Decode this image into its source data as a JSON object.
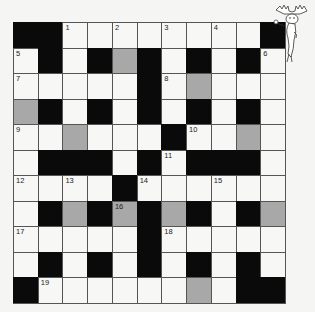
{
  "puzzle": {
    "rows": 11,
    "cols": 11,
    "legend": {
      "B": "black-block",
      "W": "white-cell",
      "G": "shaded-cell"
    },
    "grid": [
      [
        "B",
        "B",
        "W",
        "W",
        "W",
        "W",
        "W",
        "W",
        "W",
        "W",
        "B"
      ],
      [
        "W",
        "B",
        "W",
        "B",
        "G",
        "B",
        "W",
        "B",
        "W",
        "B",
        "W"
      ],
      [
        "W",
        "W",
        "W",
        "W",
        "W",
        "B",
        "W",
        "G",
        "W",
        "W",
        "W"
      ],
      [
        "G",
        "B",
        "W",
        "B",
        "W",
        "B",
        "W",
        "B",
        "W",
        "B",
        "W"
      ],
      [
        "W",
        "W",
        "G",
        "W",
        "W",
        "W",
        "B",
        "W",
        "W",
        "G",
        "W"
      ],
      [
        "W",
        "B",
        "B",
        "B",
        "W",
        "B",
        "W",
        "B",
        "B",
        "B",
        "W"
      ],
      [
        "W",
        "W",
        "W",
        "W",
        "B",
        "W",
        "W",
        "W",
        "W",
        "W",
        "W"
      ],
      [
        "W",
        "B",
        "G",
        "B",
        "G",
        "B",
        "G",
        "B",
        "W",
        "B",
        "G"
      ],
      [
        "W",
        "W",
        "W",
        "W",
        "W",
        "B",
        "W",
        "W",
        "W",
        "W",
        "W"
      ],
      [
        "W",
        "B",
        "W",
        "B",
        "W",
        "B",
        "W",
        "B",
        "W",
        "B",
        "W"
      ],
      [
        "B",
        "W",
        "W",
        "W",
        "W",
        "W",
        "W",
        "G",
        "W",
        "B",
        "B"
      ]
    ],
    "numbers": [
      {
        "row": 0,
        "col": 2,
        "n": "1"
      },
      {
        "row": 0,
        "col": 4,
        "n": "2"
      },
      {
        "row": 0,
        "col": 6,
        "n": "3"
      },
      {
        "row": 0,
        "col": 8,
        "n": "4"
      },
      {
        "row": 1,
        "col": 0,
        "n": "5"
      },
      {
        "row": 1,
        "col": 10,
        "n": "6"
      },
      {
        "row": 2,
        "col": 0,
        "n": "7"
      },
      {
        "row": 2,
        "col": 6,
        "n": "8"
      },
      {
        "row": 4,
        "col": 0,
        "n": "9"
      },
      {
        "row": 4,
        "col": 7,
        "n": "10"
      },
      {
        "row": 5,
        "col": 6,
        "n": "11"
      },
      {
        "row": 6,
        "col": 0,
        "n": "12"
      },
      {
        "row": 6,
        "col": 2,
        "n": "13"
      },
      {
        "row": 6,
        "col": 5,
        "n": "14"
      },
      {
        "row": 6,
        "col": 8,
        "n": "15"
      },
      {
        "row": 7,
        "col": 4,
        "n": "16"
      },
      {
        "row": 8,
        "col": 0,
        "n": "17"
      },
      {
        "row": 8,
        "col": 6,
        "n": "18"
      },
      {
        "row": 10,
        "col": 1,
        "n": "19"
      }
    ],
    "colors": {
      "black": "#0a0a0a",
      "shaded": "#a8a8a8",
      "white": "#f7f7f5",
      "line": "#555555"
    }
  },
  "mascot": {
    "icon": "moose-mascot-icon"
  }
}
